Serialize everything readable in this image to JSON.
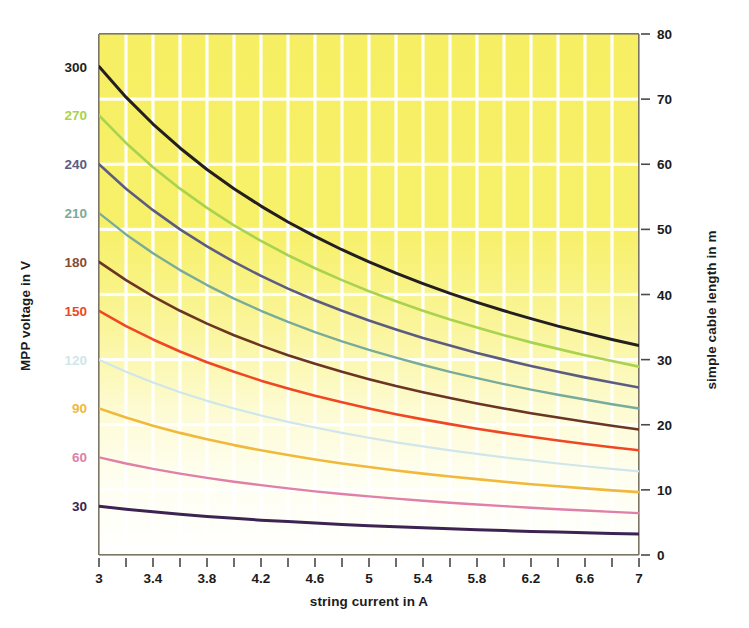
{
  "chart_data": {
    "type": "line",
    "title": "",
    "xlabel": "string current in A",
    "ylabel": "MPP voltage in V",
    "y2label": "simple cable length in m",
    "xlim": [
      3,
      7
    ],
    "ylim": [
      0,
      320
    ],
    "y2lim": [
      0,
      80
    ],
    "grid": true,
    "grid_color": "#ffffff",
    "legend": "none",
    "background_gradient_top": "#f6ef63",
    "background_gradient_bottom": "#ffffff",
    "xticks": [
      "3",
      "3.4",
      "3.8",
      "4.2",
      "4.6",
      "5",
      "5.4",
      "5.8",
      "6.2",
      "6.6",
      "7"
    ],
    "xtick_values": [
      3,
      3.4,
      3.8,
      4.2,
      4.6,
      5,
      5.4,
      5.8,
      6.2,
      6.6,
      7
    ],
    "xtick_minor_step": 0.2,
    "yticks": [
      "30",
      "60",
      "90",
      "120",
      "150",
      "180",
      "210",
      "240",
      "270",
      "300"
    ],
    "ytick_values": [
      30,
      60,
      90,
      120,
      150,
      180,
      210,
      240,
      270,
      300
    ],
    "y2ticks": [
      "0",
      "10",
      "20",
      "30",
      "40",
      "50",
      "60",
      "70",
      "80"
    ],
    "y2tick_values": [
      0,
      10,
      20,
      30,
      40,
      50,
      60,
      70,
      80
    ],
    "ytick_colors": [
      "#3d2352",
      "#e07fa8",
      "#f0b93c",
      "#cfe6ea",
      "#ef4724",
      "#8a4a30",
      "#79ab9a",
      "#5c5c82",
      "#a9d24f",
      "#231f20"
    ],
    "x": [
      3,
      3.2,
      3.4,
      3.6,
      3.8,
      4,
      4.2,
      4.4,
      4.6,
      4.8,
      5,
      5.2,
      5.4,
      5.6,
      5.8,
      6,
      6.2,
      6.4,
      6.6,
      6.8,
      7
    ],
    "series": [
      {
        "name": "300 V",
        "color": "#231f20",
        "width": 3.0,
        "start_voltage": 300,
        "end_voltage": 128.6,
        "end_cable_length_m": 30,
        "values": [
          300.0,
          281.2,
          264.7,
          250.0,
          236.8,
          225.0,
          214.3,
          204.5,
          195.7,
          187.5,
          180.0,
          173.1,
          166.7,
          160.7,
          155.2,
          150.0,
          145.2,
          140.6,
          136.4,
          132.4,
          128.6
        ]
      },
      {
        "name": "270 V",
        "color": "#a9d24f",
        "width": 2.6,
        "start_voltage": 270,
        "end_voltage": 115.7,
        "end_cable_length_m": 27,
        "values": [
          270.0,
          253.1,
          238.2,
          225.0,
          213.2,
          202.5,
          192.9,
          184.1,
          176.1,
          168.8,
          162.0,
          155.8,
          150.0,
          144.6,
          139.7,
          135.0,
          130.6,
          126.6,
          122.7,
          119.1,
          115.7
        ]
      },
      {
        "name": "240 V",
        "color": "#5c5c82",
        "width": 2.6,
        "start_voltage": 240,
        "end_voltage": 102.9,
        "end_cable_length_m": 24,
        "values": [
          240.0,
          225.0,
          211.8,
          200.0,
          189.5,
          180.0,
          171.4,
          163.6,
          156.5,
          150.0,
          144.0,
          138.5,
          133.3,
          128.6,
          124.1,
          120.0,
          116.1,
          112.5,
          109.1,
          105.9,
          102.9
        ]
      },
      {
        "name": "210 V",
        "color": "#79ab9a",
        "width": 2.4,
        "start_voltage": 210,
        "end_voltage": 90.0,
        "end_cable_length_m": 21,
        "values": [
          210.0,
          196.9,
          185.3,
          175.0,
          165.8,
          157.5,
          150.0,
          143.2,
          136.9,
          131.2,
          126.0,
          121.2,
          116.7,
          112.5,
          108.6,
          105.0,
          101.6,
          98.4,
          95.5,
          92.6,
          90.0
        ]
      },
      {
        "name": "180 V",
        "color": "#6b3524",
        "width": 2.6,
        "start_voltage": 180,
        "end_voltage": 77.1,
        "end_cable_length_m": 18,
        "values": [
          180.0,
          168.8,
          158.8,
          150.0,
          142.1,
          135.0,
          128.6,
          122.7,
          117.4,
          112.5,
          108.0,
          103.8,
          100.0,
          96.4,
          93.1,
          90.0,
          87.1,
          84.4,
          81.8,
          79.4,
          77.1
        ]
      },
      {
        "name": "150 V",
        "color": "#ef4724",
        "width": 2.6,
        "start_voltage": 150,
        "end_voltage": 64.3,
        "end_cable_length_m": 15,
        "values": [
          150.0,
          140.6,
          132.4,
          125.0,
          118.4,
          112.5,
          107.1,
          102.3,
          97.8,
          93.8,
          90.0,
          86.5,
          83.3,
          80.4,
          77.6,
          75.0,
          72.6,
          70.3,
          68.2,
          66.2,
          64.3
        ]
      },
      {
        "name": "120 V",
        "color": "#cfe6ea",
        "width": 2.2,
        "start_voltage": 120,
        "end_voltage": 51.4,
        "end_cable_length_m": 12,
        "values": [
          120.0,
          112.5,
          105.9,
          100.0,
          94.7,
          90.0,
          85.7,
          81.8,
          78.3,
          75.0,
          72.0,
          69.2,
          66.7,
          64.3,
          62.1,
          60.0,
          58.1,
          56.2,
          54.5,
          52.9,
          51.4
        ]
      },
      {
        "name": "90 V",
        "color": "#f0b93c",
        "width": 2.6,
        "start_voltage": 90,
        "end_voltage": 38.6,
        "end_cable_length_m": 9,
        "values": [
          90.0,
          84.4,
          79.4,
          75.0,
          71.1,
          67.5,
          64.3,
          61.4,
          58.7,
          56.2,
          54.0,
          51.9,
          50.0,
          48.2,
          46.6,
          45.0,
          43.5,
          42.2,
          40.9,
          39.7,
          38.6
        ]
      },
      {
        "name": "60 V",
        "color": "#e07fa8",
        "width": 2.4,
        "start_voltage": 60,
        "end_voltage": 25.7,
        "end_cable_length_m": 6,
        "values": [
          60.0,
          56.2,
          52.9,
          50.0,
          47.4,
          45.0,
          42.9,
          40.9,
          39.1,
          37.5,
          36.0,
          34.6,
          33.3,
          32.1,
          31.0,
          30.0,
          29.0,
          28.1,
          27.3,
          26.5,
          25.7
        ]
      },
      {
        "name": "30 V",
        "color": "#3d2352",
        "width": 3.0,
        "start_voltage": 30,
        "end_voltage": 12.9,
        "end_cable_length_m": 3,
        "values": [
          30.0,
          28.1,
          26.5,
          25.0,
          23.7,
          22.5,
          21.4,
          20.5,
          19.6,
          18.8,
          18.0,
          17.3,
          16.7,
          16.1,
          15.5,
          15.0,
          14.5,
          14.1,
          13.6,
          13.2,
          12.9
        ]
      }
    ]
  }
}
